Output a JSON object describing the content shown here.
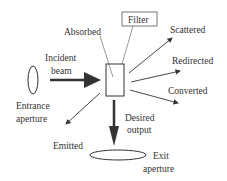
{
  "diagram": {
    "labels": {
      "absorbed": "Absorbed",
      "filter": "Filter",
      "scattered": "Scattered",
      "incident_line1": "Incident",
      "incident_line2": "beam",
      "redirected": "Redirected",
      "converted": "Converted",
      "entrance_line1": "Entrance",
      "entrance_line2": "aperture",
      "emitted": "Emitted",
      "desired_line1": "Desired",
      "desired_line2": "output",
      "exit_line1": "Exit",
      "exit_line2": "aperture"
    },
    "colors": {
      "stroke": "#333333",
      "background": "#ffffff"
    }
  }
}
